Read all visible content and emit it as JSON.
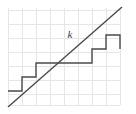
{
  "figure": {
    "canvas": {
      "width": 136,
      "height": 114,
      "background": "#ffffff"
    },
    "grid": {
      "cell_size": 14,
      "color": "#e6e6e6",
      "x_lines": [
        8,
        22,
        36,
        50,
        64,
        78,
        92,
        106,
        120
      ],
      "y_lines": [
        10,
        24,
        38,
        52,
        66,
        80,
        94,
        105
      ],
      "visible": true
    },
    "line_k": {
      "label": "k",
      "color": "#4a4a4a",
      "x1": 8,
      "y1": 107,
      "x2": 122,
      "y2": 7,
      "label_x": 70,
      "label_y": 38
    },
    "staircase": {
      "color": "#4a4a4a",
      "stroke_width": 1.4,
      "points": "8,91 22,91 22,77 36,77 36,63 92,63 92,49 106,49 106,35 120,35 120,49"
    }
  }
}
